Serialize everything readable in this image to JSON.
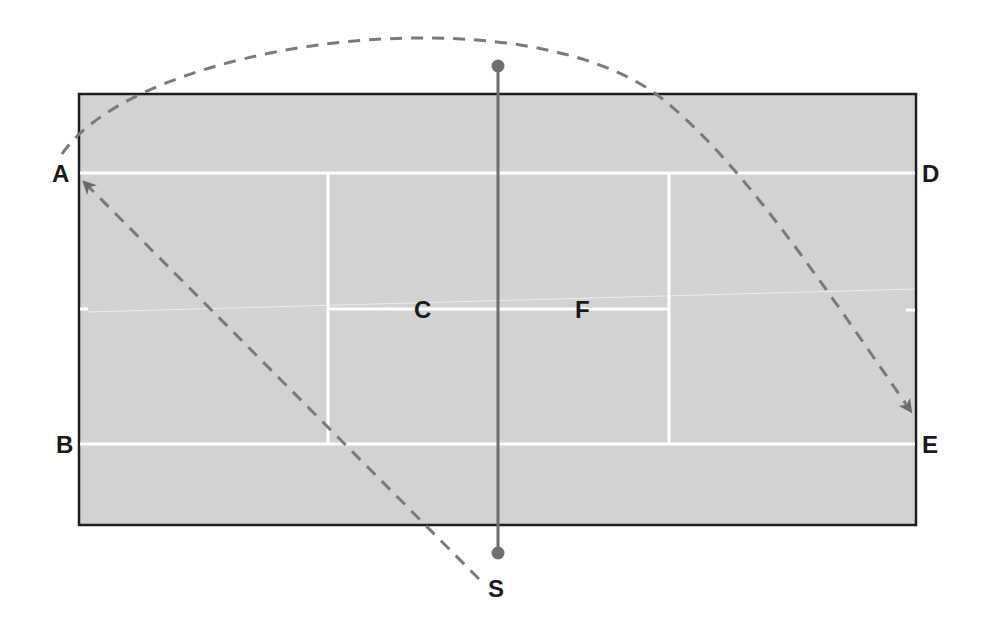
{
  "diagram": {
    "colors": {
      "court_fill": "#d2d2d2",
      "court_border": "#1e1e1e",
      "court_lines": "#ffffff",
      "net": "#6f6f6f",
      "trajectory": "#7a7a7a",
      "label": "#1a1a1a"
    },
    "labels": {
      "A": "A",
      "B": "B",
      "C": "C",
      "D": "D",
      "E": "E",
      "F": "F",
      "S": "S"
    },
    "paths": [
      {
        "name": "lob-arc",
        "from": "A",
        "to": "E",
        "style": "dashed",
        "arrow": "end"
      },
      {
        "name": "cross-diagonal",
        "from": "S",
        "to": "A",
        "style": "dashed",
        "arrow": "end"
      }
    ],
    "net": {
      "endpoints": "dots",
      "orientation": "vertical"
    }
  }
}
